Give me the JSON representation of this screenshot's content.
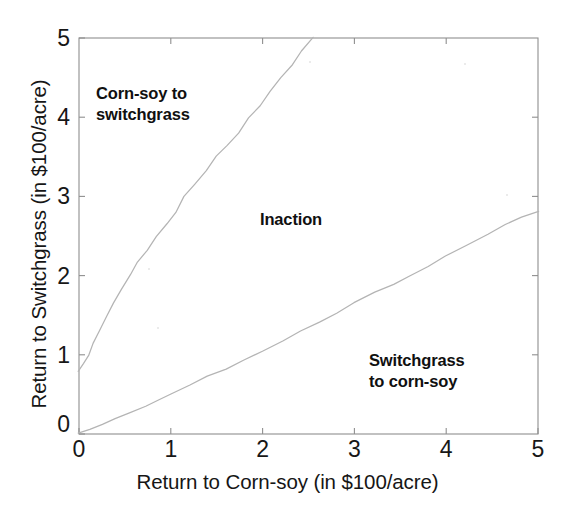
{
  "chart_data": {
    "type": "line",
    "title": "",
    "xlabel": "Return to Corn-soy (in $100/acre)",
    "ylabel": "Return to Switchgrass (in $100/acre)",
    "xlim": [
      0,
      5
    ],
    "ylim": [
      0,
      5
    ],
    "xticks": [
      "0",
      "1",
      "2",
      "3",
      "4",
      "5"
    ],
    "yticks": [
      "0",
      "1",
      "2",
      "3",
      "4",
      "5"
    ],
    "xtick_values": [
      0,
      1,
      2,
      3,
      4,
      5
    ],
    "ytick_values": [
      0,
      1,
      2,
      3,
      4,
      5
    ],
    "grid": false,
    "legend": "none",
    "series": [
      {
        "name": "Corn-soy to switchgrass boundary",
        "color": "#b4b4b4",
        "x": [
          0.0,
          0.05,
          0.1,
          0.16,
          0.22,
          0.3,
          0.38,
          0.46,
          0.55,
          0.64,
          0.74,
          0.85,
          0.96,
          1.05,
          1.15,
          1.26,
          1.38,
          1.5,
          1.61,
          1.73,
          1.85,
          1.97,
          2.09,
          2.2,
          2.32,
          2.43,
          2.55
        ],
        "y": [
          0.78,
          0.9,
          1.0,
          1.15,
          1.3,
          1.5,
          1.65,
          1.82,
          2.0,
          2.16,
          2.33,
          2.5,
          2.66,
          2.8,
          3.0,
          3.15,
          3.32,
          3.5,
          3.63,
          3.81,
          4.0,
          4.15,
          4.33,
          4.5,
          4.66,
          4.83,
          5.0
        ]
      },
      {
        "name": "Switchgrass to corn-soy boundary",
        "color": "#b4b4b4",
        "x": [
          0.0,
          0.12,
          0.25,
          0.4,
          0.55,
          0.72,
          0.86,
          1.0,
          1.2,
          1.4,
          1.6,
          1.8,
          2.0,
          2.22,
          2.42,
          2.62,
          2.8,
          3.0,
          3.22,
          3.42,
          3.6,
          3.8,
          4.0,
          4.22,
          4.45,
          4.65,
          4.82,
          5.0
        ],
        "y": [
          0.0,
          0.07,
          0.13,
          0.2,
          0.27,
          0.35,
          0.42,
          0.5,
          0.61,
          0.72,
          0.83,
          0.94,
          1.05,
          1.18,
          1.3,
          1.41,
          1.52,
          1.65,
          1.78,
          1.9,
          2.0,
          2.12,
          2.25,
          2.38,
          2.52,
          2.64,
          2.73,
          2.8
        ]
      }
    ],
    "annotations": [
      {
        "id": "corn-to-switchgrass",
        "text": "Corn-soy to\nswitchgrass",
        "x": 0.25,
        "y": 4.35
      },
      {
        "id": "inaction",
        "text": "Inaction",
        "x": 2.55,
        "y": 2.85
      },
      {
        "id": "switchgrass-to-corn",
        "text": "Switchgrass\nto corn-soy",
        "x": 3.85,
        "y": 1.15
      }
    ],
    "colors": {
      "axis": "#8c8c8c",
      "curve": "#b4b4b4",
      "text": "#161616",
      "background": "#ffffff"
    }
  }
}
